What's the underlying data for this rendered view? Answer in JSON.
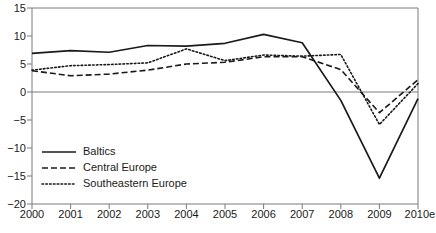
{
  "chart_data": {
    "type": "line",
    "title": "",
    "subtitle": "",
    "xlabel": "",
    "ylabel": "",
    "categories": [
      "2000",
      "2001",
      "2002",
      "2003",
      "2004",
      "2005",
      "2006",
      "2007",
      "2008",
      "2009",
      "2010e"
    ],
    "x_tick_labels": [
      "2000",
      "2001",
      "2002",
      "2003",
      "2004",
      "2005",
      "2006",
      "2007",
      "2008",
      "2009",
      "2010e"
    ],
    "y_tick_labels": [
      "15",
      "10",
      "5",
      "0",
      "-5",
      "-10",
      "-15",
      "-20"
    ],
    "y_ticks": [
      15,
      10,
      5,
      0,
      -5,
      -10,
      -15,
      -20
    ],
    "ylim": [
      -20,
      15
    ],
    "grid": false,
    "zero_line": true,
    "legend_position": "lower-left-inside",
    "series": [
      {
        "name": "Baltics",
        "style": "solid",
        "color": "#1a1a1a",
        "values": [
          6.9,
          7.4,
          7.1,
          8.3,
          8.2,
          8.7,
          10.3,
          8.8,
          -1.5,
          -15.4,
          -1.2
        ]
      },
      {
        "name": "Central Europe",
        "style": "dashed",
        "color": "#1a1a1a",
        "values": [
          3.8,
          2.9,
          3.2,
          3.9,
          5.0,
          5.3,
          6.3,
          6.3,
          4.0,
          -3.7,
          2.2
        ]
      },
      {
        "name": "Southeastern Europe",
        "style": "dotted",
        "color": "#1a1a1a",
        "values": [
          3.9,
          4.7,
          4.9,
          5.2,
          7.7,
          5.6,
          6.6,
          6.4,
          6.7,
          -5.8,
          1.5
        ]
      }
    ]
  },
  "legend": {
    "items": [
      {
        "label": "Baltics",
        "style": "solid"
      },
      {
        "label": "Central Europe",
        "style": "dashed"
      },
      {
        "label": "Southeastern Europe",
        "style": "dotted"
      }
    ]
  },
  "colors": {
    "line": "#1a1a1a",
    "axis": "#7a7a7a",
    "zero_line": "#7a7a7a",
    "background": "#ffffff"
  }
}
